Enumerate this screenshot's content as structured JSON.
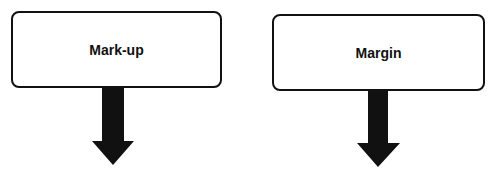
{
  "diagram": {
    "nodes": [
      {
        "id": "markup",
        "label": "Mark-up"
      },
      {
        "id": "margin",
        "label": "Margin"
      }
    ],
    "arrows": [
      {
        "from": "markup",
        "direction": "down"
      },
      {
        "from": "margin",
        "direction": "down"
      }
    ],
    "colors": {
      "stroke": "#111111",
      "fill": "#ffffff"
    }
  }
}
